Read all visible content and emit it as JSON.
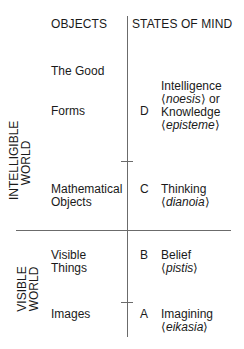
{
  "headers": {
    "objects": "OBJECTS",
    "states": "STATES OF MIND"
  },
  "sections": {
    "intelligible": {
      "line1": "INTELLIGIBLE",
      "line2": "WORLD"
    },
    "visible": {
      "line1": "VISIBLE",
      "line2": "WORLD"
    }
  },
  "objects": {
    "good": "The Good",
    "forms": "Forms",
    "math_1": "Mathematical",
    "math_2": "Objects",
    "visible_1": "Visible",
    "visible_2": "Things",
    "images": "Images"
  },
  "states": [
    {
      "letter": "D",
      "lines": [
        "Intelligence",
        "noesis",
        "or",
        "Knowledge",
        "episteme"
      ]
    },
    {
      "letter": "C",
      "lines": [
        "Thinking",
        "dianoia"
      ]
    },
    {
      "letter": "B",
      "lines": [
        "Belief",
        "pistis"
      ]
    },
    {
      "letter": "A",
      "lines": [
        "Imagining",
        "eikasia"
      ]
    }
  ]
}
